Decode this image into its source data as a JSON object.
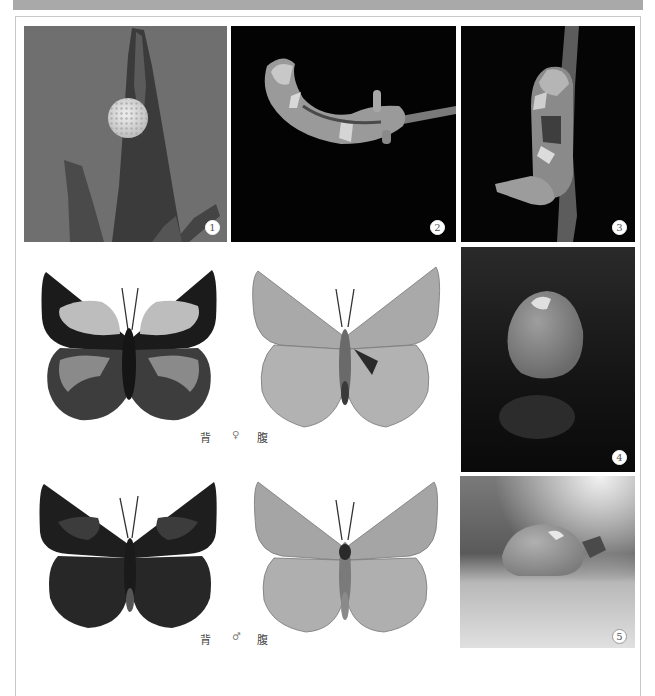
{
  "header": {
    "bar_color": "#a9a9a9"
  },
  "photos": [
    {
      "id": 1,
      "label": "1",
      "subject": "egg on plant bud",
      "background": "#6e6e6e"
    },
    {
      "id": 2,
      "label": "2",
      "subject": "larva on twig (horizontal)",
      "background": "#030303"
    },
    {
      "id": 3,
      "label": "3",
      "subject": "larva on twig (vertical)",
      "background": "#050505"
    },
    {
      "id": 4,
      "label": "4",
      "subject": "pupa, dark background",
      "background": "#1a1a1a"
    },
    {
      "id": 5,
      "label": "5",
      "subject": "pupa, light background",
      "background": "#8a8a8a"
    }
  ],
  "specimens": [
    {
      "sex": "female",
      "caption": {
        "dorsal": "背",
        "sex_symbol": "♀",
        "ventral": "腹"
      }
    },
    {
      "sex": "male",
      "caption": {
        "dorsal": "背",
        "sex_symbol": "♂",
        "ventral": "腹"
      }
    }
  ]
}
